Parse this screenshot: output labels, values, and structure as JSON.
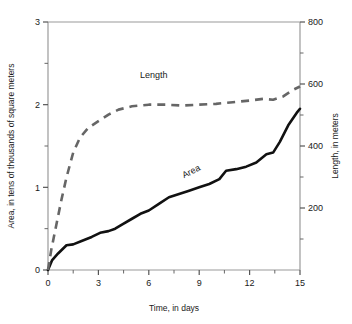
{
  "chart_data": {
    "type": "line",
    "title": "",
    "xlabel": "Time, in days",
    "ylabel": "Area, in tens of thousands of square meters",
    "y2label": "Length, in meters",
    "xlim": [
      0,
      15
    ],
    "ylim": [
      0,
      3
    ],
    "y2lim": [
      0,
      800
    ],
    "grid": false,
    "legend": "inline-annotations",
    "x_ticks": [
      "0",
      "3",
      "6",
      "9",
      "12",
      "15"
    ],
    "x_tick_values": [
      0,
      3,
      6,
      9,
      12,
      15
    ],
    "x_minor_tick_values": [
      1.5,
      4.5,
      7.5,
      10.5,
      13.5
    ],
    "y_ticks": [
      "0",
      "1",
      "2",
      "3"
    ],
    "y_tick_values": [
      0,
      1,
      2,
      3
    ],
    "y_minor_tick_values": [
      0.5,
      1.5,
      2.5
    ],
    "y2_ticks": [
      "200",
      "400",
      "600",
      "800"
    ],
    "y2_tick_values": [
      200,
      400,
      600,
      800
    ],
    "y2_minor_tick_values": [
      100,
      300,
      500,
      700
    ],
    "series": [
      {
        "name": "Area",
        "axis": "left",
        "style": "solid",
        "color": "#111111",
        "label_text": "Area",
        "label_x": 8.6,
        "label_y": 1.16,
        "label_rotation": -26,
        "x": [
          0.0,
          0.25,
          0.6,
          1.1,
          1.5,
          2.0,
          2.6,
          3.1,
          3.6,
          4.0,
          4.4,
          5.0,
          5.5,
          6.0,
          6.6,
          7.2,
          7.8,
          8.4,
          9.0,
          9.6,
          10.2,
          10.6,
          11.2,
          11.8,
          12.4,
          13.0,
          13.4,
          13.8,
          14.3,
          14.8,
          15.0
        ],
        "y": [
          0.0,
          0.12,
          0.2,
          0.3,
          0.31,
          0.35,
          0.4,
          0.45,
          0.47,
          0.5,
          0.55,
          0.62,
          0.68,
          0.72,
          0.8,
          0.88,
          0.92,
          0.96,
          1.0,
          1.04,
          1.1,
          1.2,
          1.22,
          1.25,
          1.3,
          1.4,
          1.42,
          1.55,
          1.75,
          1.9,
          1.95
        ]
      },
      {
        "name": "Length",
        "axis": "left",
        "style": "dashed",
        "color": "#666666",
        "label_text": "Length",
        "label_x": 6.3,
        "label_y": 2.32,
        "label_rotation": 0,
        "x": [
          0.0,
          0.2,
          0.5,
          0.8,
          1.1,
          1.5,
          1.9,
          2.4,
          3.0,
          3.6,
          4.2,
          5.0,
          6.0,
          7.0,
          8.0,
          9.0,
          10.0,
          11.0,
          12.0,
          12.8,
          13.4,
          14.0,
          14.6,
          15.0
        ],
        "y": [
          0.0,
          0.25,
          0.55,
          0.85,
          1.12,
          1.42,
          1.6,
          1.72,
          1.8,
          1.88,
          1.94,
          1.98,
          2.0,
          2.0,
          1.99,
          2.0,
          2.01,
          2.03,
          2.05,
          2.07,
          2.06,
          2.1,
          2.18,
          2.22
        ]
      }
    ]
  },
  "axes": {
    "left_axis_name": "area-axis",
    "right_axis_name": "length-axis",
    "bottom_axis_name": "time-axis"
  }
}
